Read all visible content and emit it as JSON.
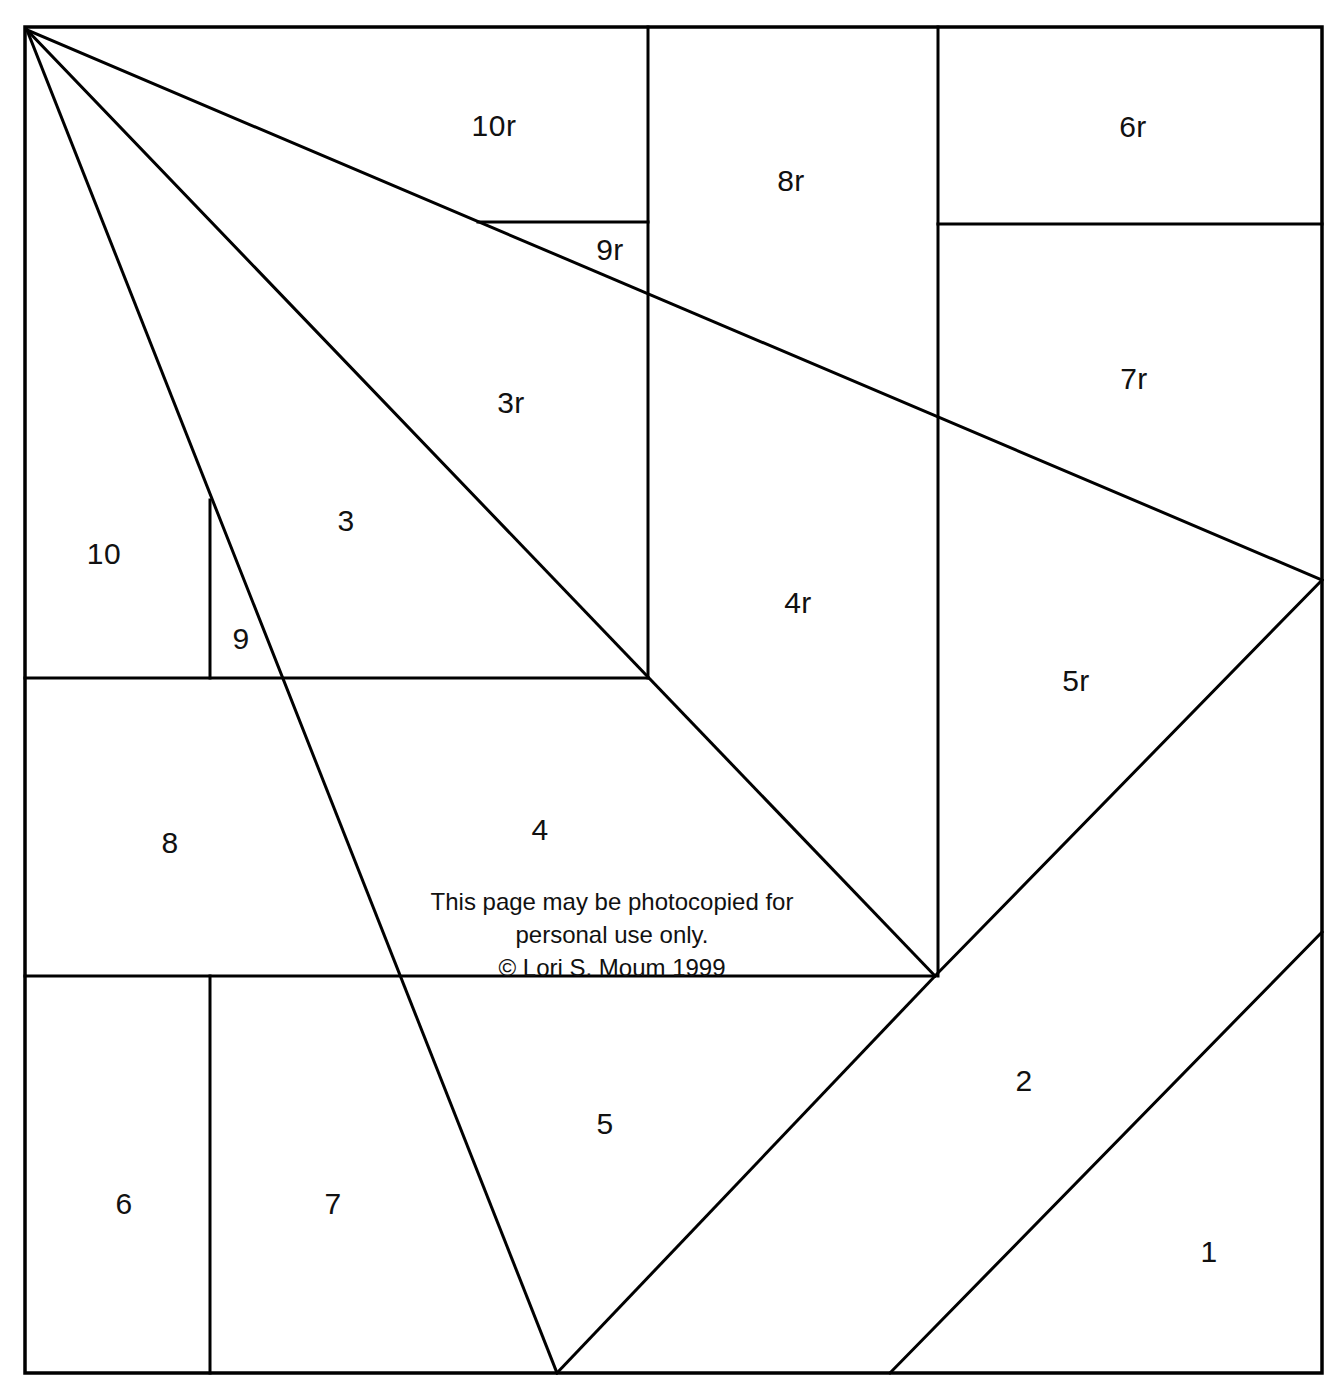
{
  "document": {
    "type": "quilt-foundation-piecing-pattern",
    "background_color": "#ffffff",
    "line_color": "#000000"
  },
  "notice": {
    "line1": "This page may be photocopied for",
    "line2": "personal use only.",
    "line3": "© Lori S. Moum 1999"
  },
  "sections": [
    {
      "label": "1",
      "x": 1209,
      "y": 1252
    },
    {
      "label": "2",
      "x": 1024,
      "y": 1081
    },
    {
      "label": "3",
      "x": 346,
      "y": 521
    },
    {
      "label": "3r",
      "x": 511,
      "y": 403
    },
    {
      "label": "4",
      "x": 540,
      "y": 830
    },
    {
      "label": "4r",
      "x": 798,
      "y": 603
    },
    {
      "label": "5",
      "x": 605,
      "y": 1124
    },
    {
      "label": "5r",
      "x": 1076,
      "y": 681
    },
    {
      "label": "6",
      "x": 124,
      "y": 1204
    },
    {
      "label": "6r",
      "x": 1133,
      "y": 127
    },
    {
      "label": "7",
      "x": 333,
      "y": 1204
    },
    {
      "label": "7r",
      "x": 1134,
      "y": 379
    },
    {
      "label": "8",
      "x": 170,
      "y": 843
    },
    {
      "label": "8r",
      "x": 791,
      "y": 181
    },
    {
      "label": "9",
      "x": 241,
      "y": 639
    },
    {
      "label": "9r",
      "x": 610,
      "y": 250
    },
    {
      "label": "10",
      "x": 104,
      "y": 554
    },
    {
      "label": "10r",
      "x": 494,
      "y": 126
    }
  ],
  "geometry": {
    "border": {
      "left": 25,
      "top": 27,
      "right": 1322,
      "bottom": 1373
    },
    "lines": [
      {
        "name": "diagonal-a-topleft-to-right-edge",
        "x1": 27,
        "y1": 30,
        "x2": 1322,
        "y2": 580
      },
      {
        "name": "diagonal-b-topleft-to-apex",
        "x1": 27,
        "y1": 30,
        "x2": 935,
        "y2": 976
      },
      {
        "name": "diagonal-c-topleft-to-bottom",
        "x1": 27,
        "y1": 30,
        "x2": 557,
        "y2": 1373
      },
      {
        "name": "diagonal-d-apex-to-bottom",
        "x1": 935,
        "y1": 976,
        "x2": 557,
        "y2": 1373
      },
      {
        "name": "diagonal-e-apex-to-right-edge",
        "x1": 935,
        "y1": 976,
        "x2": 1322,
        "y2": 580
      },
      {
        "name": "diagonal-f-lower-right",
        "x1": 890,
        "y1": 1373,
        "x2": 1322,
        "y2": 932
      },
      {
        "name": "vertical-648-top",
        "x1": 648,
        "y1": 27,
        "x2": 648,
        "y2": 678
      },
      {
        "name": "vertical-938-top",
        "x1": 938,
        "y1": 27,
        "x2": 938,
        "y2": 976
      },
      {
        "name": "vertical-210-mid",
        "x1": 210,
        "y1": 500,
        "x2": 210,
        "y2": 678
      },
      {
        "name": "vertical-210-bottom",
        "x1": 210,
        "y1": 976,
        "x2": 210,
        "y2": 1373
      },
      {
        "name": "horizontal-222-9r",
        "x1": 478,
        "y1": 222,
        "x2": 648,
        "y2": 222
      },
      {
        "name": "horizontal-224-6r",
        "x1": 938,
        "y1": 224,
        "x2": 1322,
        "y2": 224
      },
      {
        "name": "horizontal-678",
        "x1": 25,
        "y1": 678,
        "x2": 648,
        "y2": 678
      },
      {
        "name": "horizontal-976",
        "x1": 25,
        "y1": 976,
        "x2": 935,
        "y2": 976
      }
    ]
  }
}
